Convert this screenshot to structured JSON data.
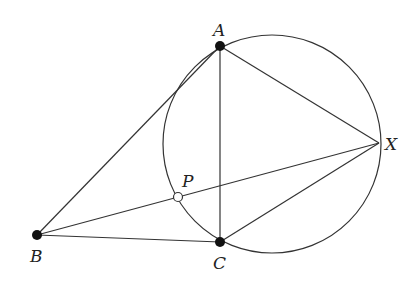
{
  "diagram": {
    "circle": {
      "cx": 272,
      "cy": 144,
      "r": 109
    },
    "points": {
      "A": {
        "label": "A",
        "x": 220,
        "y": 46,
        "style": "filled",
        "lx": 213,
        "ly": 22
      },
      "B": {
        "label": "B",
        "x": 37,
        "y": 235,
        "style": "filled",
        "lx": 30,
        "ly": 248
      },
      "C": {
        "label": "C",
        "x": 220,
        "y": 242,
        "style": "filled",
        "lx": 213,
        "ly": 255
      },
      "X": {
        "label": "X",
        "x": 379,
        "y": 143,
        "style": "none",
        "lx": 385,
        "ly": 136
      },
      "P": {
        "label": "P",
        "x": 178,
        "y": 197,
        "style": "open",
        "lx": 182,
        "ly": 173
      }
    },
    "segments": [
      [
        "A",
        "B"
      ],
      [
        "B",
        "C"
      ],
      [
        "B",
        "X"
      ],
      [
        "A",
        "C"
      ],
      [
        "A",
        "X"
      ],
      [
        "C",
        "X"
      ]
    ],
    "colors": {
      "stroke": "#333333",
      "point": "#111111",
      "background": "#ffffff"
    }
  }
}
